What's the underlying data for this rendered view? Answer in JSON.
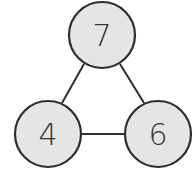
{
  "diagram": {
    "type": "graph",
    "nodes": [
      {
        "id": "top",
        "label": "7",
        "cx": 102,
        "cy": 35,
        "r": 34
      },
      {
        "id": "bottom-left",
        "label": "4",
        "cx": 48,
        "cy": 134,
        "r": 34
      },
      {
        "id": "bottom-right",
        "label": "6",
        "cx": 158,
        "cy": 134,
        "r": 34
      }
    ],
    "edges": [
      {
        "from": "top",
        "to": "bottom-left"
      },
      {
        "from": "top",
        "to": "bottom-right"
      },
      {
        "from": "bottom-left",
        "to": "bottom-right"
      }
    ],
    "colors": {
      "node_fill": "#e5e5e5",
      "stroke": "#2e2e2e",
      "label": "#333333"
    }
  }
}
